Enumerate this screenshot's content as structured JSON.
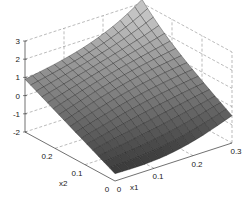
{
  "chart_data": {
    "type": "surface",
    "title": "",
    "xlabel": "x1",
    "ylabel": "x2",
    "zlabel": "",
    "xlim": [
      0,
      0.3
    ],
    "ylim": [
      0,
      0.3
    ],
    "zlim": [
      -2,
      3
    ],
    "x_ticks": [
      "0",
      "0.1",
      "0.2",
      "0.3"
    ],
    "y_ticks": [
      "0",
      "0.1",
      "0.2"
    ],
    "z_ticks": [
      "-2",
      "-1",
      "0",
      "1",
      "2",
      "3"
    ],
    "grid": true,
    "colormap": "gray",
    "grid_size": 16,
    "corner_values": {
      "x1_0_x2_0": -1.6,
      "x1_0.3_x2_0": -0.5,
      "x1_0_x2_0.3": 0.9,
      "x1_0.3_x2_0.3": 2.0
    }
  },
  "labels": {
    "x1": "x1",
    "x2": "x2"
  }
}
